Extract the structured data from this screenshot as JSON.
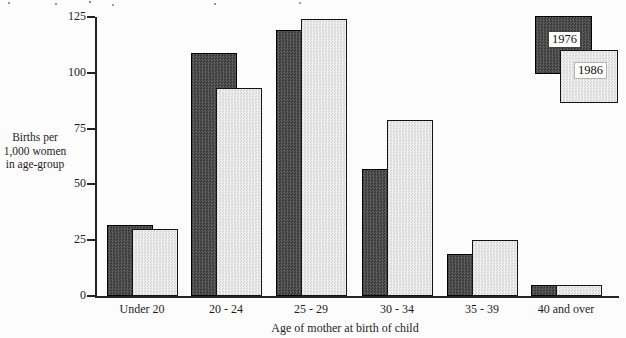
{
  "figure": {
    "ylabel_lines": [
      "Births per",
      "1,000 women",
      "in age-group"
    ],
    "xlabel": "Age of mother at birth of child",
    "legend": {
      "series1": "1976",
      "series2": "1986"
    }
  },
  "chart_data": {
    "type": "bar",
    "title": "",
    "categories": [
      "Under 20",
      "20 - 24",
      "25 - 29",
      "30 - 34",
      "35 - 39",
      "40 and over"
    ],
    "series": [
      {
        "name": "1976",
        "values": [
          32,
          109,
          119,
          57,
          19,
          5
        ],
        "color": "#474747",
        "pattern": "dark-crosshatch"
      },
      {
        "name": "1986",
        "values": [
          30,
          93,
          124,
          79,
          25,
          5
        ],
        "color": "#e6e6e6",
        "pattern": "light-stipple"
      }
    ],
    "xlabel": "Age of mother at birth of child",
    "ylabel": "Births per 1,000 women in age-group",
    "ylim": [
      0,
      125
    ],
    "yticks": [
      0,
      25,
      50,
      75,
      100,
      125
    ],
    "grid": false,
    "legend_position": "top-right",
    "bar_style": "paired-overlapping-offset"
  }
}
